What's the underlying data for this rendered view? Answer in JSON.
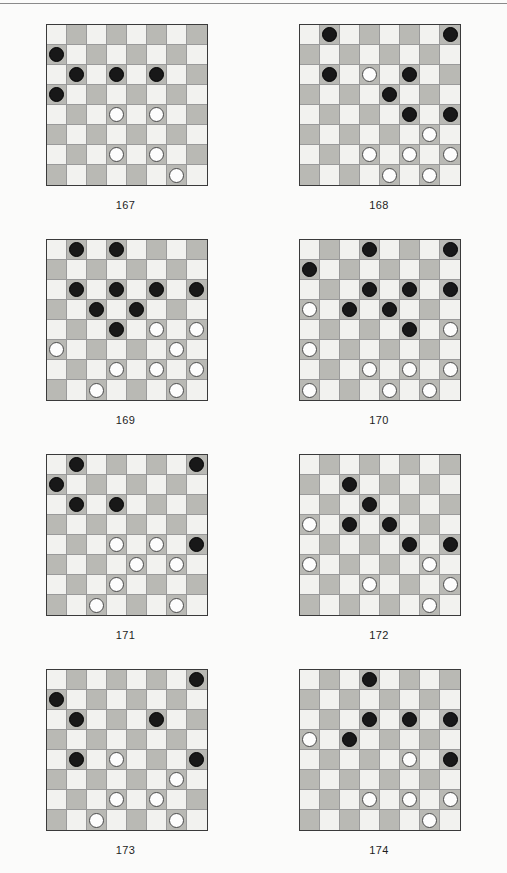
{
  "page": {
    "background_color": "#fbfbfa",
    "rule_color": "#8a8a8a",
    "board_size": 8,
    "light_square_color": "#f2f2ef",
    "dark_square_color": "#b9b9b4",
    "black_piece_color": "#181818",
    "white_piece_color": "#fdfdfd",
    "board_border_color": "#3a3a3a"
  },
  "diagrams": [
    {
      "label": "167",
      "black": [
        [
          1,
          0
        ],
        [
          2,
          1
        ],
        [
          2,
          3
        ],
        [
          2,
          5
        ],
        [
          3,
          0
        ]
      ],
      "white": [
        [
          4,
          3
        ],
        [
          4,
          5
        ],
        [
          6,
          3
        ],
        [
          6,
          5
        ],
        [
          7,
          6
        ]
      ]
    },
    {
      "label": "168",
      "black": [
        [
          0,
          1
        ],
        [
          0,
          7
        ],
        [
          2,
          1
        ],
        [
          2,
          5
        ],
        [
          3,
          4
        ],
        [
          4,
          5
        ],
        [
          4,
          7
        ]
      ],
      "white": [
        [
          2,
          3
        ],
        [
          5,
          6
        ],
        [
          6,
          3
        ],
        [
          6,
          5
        ],
        [
          6,
          7
        ],
        [
          7,
          4
        ],
        [
          7,
          6
        ]
      ]
    },
    {
      "label": "169",
      "black": [
        [
          0,
          1
        ],
        [
          0,
          3
        ],
        [
          2,
          1
        ],
        [
          2,
          3
        ],
        [
          2,
          5
        ],
        [
          2,
          7
        ],
        [
          3,
          2
        ],
        [
          3,
          4
        ],
        [
          4,
          3
        ]
      ],
      "white": [
        [
          4,
          5
        ],
        [
          4,
          7
        ],
        [
          5,
          0
        ],
        [
          5,
          6
        ],
        [
          6,
          3
        ],
        [
          6,
          5
        ],
        [
          6,
          7
        ],
        [
          7,
          2
        ],
        [
          7,
          6
        ]
      ]
    },
    {
      "label": "170",
      "black": [
        [
          0,
          3
        ],
        [
          0,
          7
        ],
        [
          1,
          0
        ],
        [
          2,
          3
        ],
        [
          2,
          5
        ],
        [
          2,
          7
        ],
        [
          3,
          2
        ],
        [
          3,
          4
        ],
        [
          4,
          5
        ]
      ],
      "white": [
        [
          3,
          0
        ],
        [
          4,
          7
        ],
        [
          5,
          0
        ],
        [
          6,
          3
        ],
        [
          6,
          5
        ],
        [
          6,
          7
        ],
        [
          7,
          0
        ],
        [
          7,
          4
        ],
        [
          7,
          6
        ]
      ]
    },
    {
      "label": "171",
      "black": [
        [
          0,
          1
        ],
        [
          0,
          7
        ],
        [
          1,
          0
        ],
        [
          2,
          1
        ],
        [
          2,
          3
        ],
        [
          4,
          7
        ]
      ],
      "white": [
        [
          4,
          3
        ],
        [
          4,
          5
        ],
        [
          5,
          4
        ],
        [
          5,
          6
        ],
        [
          6,
          3
        ],
        [
          7,
          2
        ],
        [
          7,
          6
        ]
      ]
    },
    {
      "label": "172",
      "black": [
        [
          1,
          2
        ],
        [
          2,
          3
        ],
        [
          3,
          2
        ],
        [
          3,
          4
        ],
        [
          4,
          5
        ],
        [
          4,
          7
        ]
      ],
      "white": [
        [
          3,
          0
        ],
        [
          5,
          0
        ],
        [
          5,
          6
        ],
        [
          6,
          3
        ],
        [
          6,
          7
        ],
        [
          7,
          6
        ]
      ]
    },
    {
      "label": "173",
      "black": [
        [
          0,
          7
        ],
        [
          1,
          0
        ],
        [
          2,
          1
        ],
        [
          2,
          5
        ],
        [
          4,
          1
        ],
        [
          4,
          7
        ]
      ],
      "white": [
        [
          4,
          3
        ],
        [
          5,
          6
        ],
        [
          6,
          3
        ],
        [
          6,
          5
        ],
        [
          7,
          2
        ],
        [
          7,
          6
        ]
      ]
    },
    {
      "label": "174",
      "black": [
        [
          0,
          3
        ],
        [
          2,
          3
        ],
        [
          2,
          5
        ],
        [
          2,
          7
        ],
        [
          3,
          2
        ],
        [
          4,
          7
        ]
      ],
      "white": [
        [
          3,
          0
        ],
        [
          4,
          5
        ],
        [
          6,
          3
        ],
        [
          6,
          5
        ],
        [
          6,
          7
        ],
        [
          7,
          6
        ]
      ]
    }
  ]
}
